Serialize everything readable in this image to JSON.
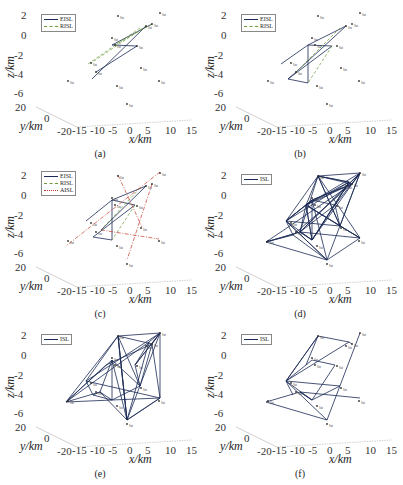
{
  "figure": {
    "panels": [
      {
        "id": "a",
        "caption": "(a)",
        "legend": [
          "EISL",
          "RISL"
        ]
      },
      {
        "id": "b",
        "caption": "(b)",
        "legend": [
          "EISL",
          "RISL"
        ]
      },
      {
        "id": "c",
        "caption": "(c)",
        "legend": [
          "EISL",
          "RISL",
          "AISL"
        ]
      },
      {
        "id": "d",
        "caption": "(d)",
        "legend": [
          "ISL"
        ]
      },
      {
        "id": "e",
        "caption": "(e)",
        "legend": [
          "ISL"
        ]
      },
      {
        "id": "f",
        "caption": "(f)",
        "legend": [
          "ISL"
        ]
      }
    ],
    "axes": {
      "z_label": "z/km",
      "y_label": "y/km",
      "x_label": "x/km",
      "z_ticks": [
        "2",
        "0",
        "-2",
        "-4",
        "-6"
      ],
      "y_ticks": [
        "20",
        "0",
        "-20"
      ],
      "x_ticks": [
        "-15",
        "-10",
        "-5",
        "0",
        "5",
        "10",
        "15"
      ]
    }
  },
  "chart_data": [
    {
      "type": "scatter",
      "subtype": "3d-network",
      "title": "(a)",
      "xlabel": "x/km",
      "ylabel": "y/km",
      "zlabel": "z/km",
      "xlim": [
        -15,
        15
      ],
      "ylim": [
        -20,
        20
      ],
      "zlim": [
        -6,
        2
      ],
      "series": [
        {
          "name": "EISL",
          "style": "solid",
          "color": "#1a2a55"
        },
        {
          "name": "RISL",
          "style": "dashed",
          "color": "#6a9a3a"
        }
      ]
    },
    {
      "type": "scatter",
      "subtype": "3d-network",
      "title": "(b)",
      "xlabel": "x/km",
      "ylabel": "y/km",
      "zlabel": "z/km",
      "xlim": [
        -15,
        15
      ],
      "ylim": [
        -20,
        20
      ],
      "zlim": [
        -6,
        2
      ],
      "series": [
        {
          "name": "EISL",
          "style": "solid",
          "color": "#1a2a55"
        },
        {
          "name": "RISL",
          "style": "dashed",
          "color": "#6a9a3a"
        }
      ]
    },
    {
      "type": "scatter",
      "subtype": "3d-network",
      "title": "(c)",
      "xlabel": "x/km",
      "ylabel": "y/km",
      "zlabel": "z/km",
      "xlim": [
        -15,
        15
      ],
      "ylim": [
        -20,
        20
      ],
      "zlim": [
        -6,
        2
      ],
      "series": [
        {
          "name": "EISL",
          "style": "solid",
          "color": "#1a2a55"
        },
        {
          "name": "RISL",
          "style": "dashed",
          "color": "#6a9a3a"
        },
        {
          "name": "AISL",
          "style": "dash-dot",
          "color": "#c0392b"
        }
      ]
    },
    {
      "type": "scatter",
      "subtype": "3d-network",
      "title": "(d)",
      "xlabel": "x/km",
      "ylabel": "y/km",
      "zlabel": "z/km",
      "xlim": [
        -15,
        15
      ],
      "ylim": [
        -20,
        20
      ],
      "zlim": [
        -6,
        2
      ],
      "series": [
        {
          "name": "ISL",
          "style": "solid",
          "color": "#1a2a55"
        }
      ]
    },
    {
      "type": "scatter",
      "subtype": "3d-network",
      "title": "(e)",
      "xlabel": "x/km",
      "ylabel": "y/km",
      "zlabel": "z/km",
      "xlim": [
        -15,
        15
      ],
      "ylim": [
        -20,
        20
      ],
      "zlim": [
        -6,
        2
      ],
      "series": [
        {
          "name": "ISL",
          "style": "solid",
          "color": "#1a2a55"
        }
      ]
    },
    {
      "type": "scatter",
      "subtype": "3d-network",
      "title": "(f)",
      "xlabel": "x/km",
      "ylabel": "y/km",
      "zlabel": "z/km",
      "xlim": [
        -15,
        15
      ],
      "ylim": [
        -20,
        20
      ],
      "zlim": [
        -6,
        2
      ],
      "series": [
        {
          "name": "ISL",
          "style": "solid",
          "color": "#1a2a55"
        }
      ]
    }
  ]
}
